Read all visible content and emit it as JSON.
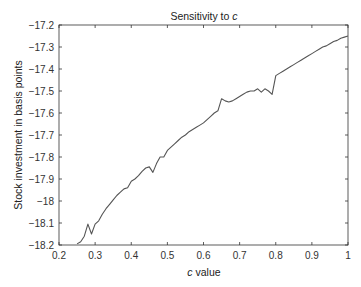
{
  "chart_data": {
    "type": "line",
    "title": "Sensitivity to c",
    "title_prefix": "Sensitivity to ",
    "title_var": "c",
    "xlabel": "c value",
    "xlabel_var": "c",
    "xlabel_rest": " value",
    "ylabel": "Stock investment in basis points",
    "xlim": [
      0.2,
      1.0
    ],
    "ylim": [
      -18.2,
      -17.2
    ],
    "grid": false,
    "legend": null,
    "xticks": [
      0.2,
      0.3,
      0.4,
      0.5,
      0.6,
      0.7,
      0.8,
      0.9,
      1
    ],
    "xtick_labels": [
      "0.2",
      "0.3",
      "0.4",
      "0.5",
      "0.6",
      "0.7",
      "0.8",
      "0.9",
      "1"
    ],
    "yticks": [
      -17.2,
      -17.3,
      -17.4,
      -17.5,
      -17.6,
      -17.7,
      -17.8,
      -17.9,
      -18,
      -18.1,
      -18.2
    ],
    "ytick_labels": [
      "-17.2",
      "-17.3",
      "-17.4",
      "-17.5",
      "-17.6",
      "-17.7",
      "-17.8",
      "-17.9",
      "-18",
      "-18.1",
      "-18.2"
    ],
    "series": [
      {
        "name": "Stock investment",
        "color": "#555555",
        "x": [
          0.25,
          0.26,
          0.27,
          0.28,
          0.29,
          0.3,
          0.31,
          0.32,
          0.33,
          0.34,
          0.35,
          0.36,
          0.37,
          0.38,
          0.39,
          0.4,
          0.41,
          0.42,
          0.43,
          0.44,
          0.45,
          0.46,
          0.47,
          0.48,
          0.49,
          0.5,
          0.51,
          0.52,
          0.53,
          0.54,
          0.55,
          0.56,
          0.57,
          0.58,
          0.59,
          0.6,
          0.61,
          0.62,
          0.63,
          0.64,
          0.65,
          0.66,
          0.67,
          0.68,
          0.69,
          0.7,
          0.71,
          0.72,
          0.73,
          0.74,
          0.75,
          0.76,
          0.77,
          0.78,
          0.79,
          0.8,
          0.81,
          0.82,
          0.83,
          0.84,
          0.85,
          0.86,
          0.87,
          0.88,
          0.89,
          0.9,
          0.91,
          0.92,
          0.93,
          0.94,
          0.95,
          0.96,
          0.97,
          0.98,
          0.99,
          1.0
        ],
        "y": [
          -18.195,
          -18.185,
          -18.16,
          -18.105,
          -18.15,
          -18.105,
          -18.09,
          -18.06,
          -18.035,
          -18.015,
          -17.995,
          -17.975,
          -17.96,
          -17.945,
          -17.94,
          -17.91,
          -17.9,
          -17.885,
          -17.865,
          -17.85,
          -17.845,
          -17.87,
          -17.83,
          -17.8,
          -17.8,
          -17.77,
          -17.755,
          -17.74,
          -17.725,
          -17.71,
          -17.7,
          -17.685,
          -17.675,
          -17.665,
          -17.655,
          -17.645,
          -17.63,
          -17.615,
          -17.6,
          -17.59,
          -17.535,
          -17.545,
          -17.55,
          -17.545,
          -17.535,
          -17.525,
          -17.515,
          -17.505,
          -17.5,
          -17.5,
          -17.49,
          -17.505,
          -17.49,
          -17.5,
          -17.515,
          -17.43,
          -17.42,
          -17.41,
          -17.4,
          -17.39,
          -17.38,
          -17.37,
          -17.36,
          -17.35,
          -17.34,
          -17.33,
          -17.32,
          -17.31,
          -17.3,
          -17.295,
          -17.285,
          -17.275,
          -17.27,
          -17.26,
          -17.255,
          -17.25
        ]
      }
    ]
  },
  "colors": {
    "line": "#555555",
    "axis": "#333333",
    "background": "#ffffff"
  }
}
